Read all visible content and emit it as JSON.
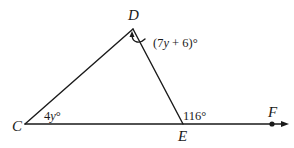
{
  "diagram": {
    "type": "geometry-triangle-exterior-angle",
    "points": {
      "C": {
        "label": "C",
        "x": 25,
        "y": 124
      },
      "D": {
        "label": "D",
        "x": 133,
        "y": 29
      },
      "E": {
        "label": "E",
        "x": 183,
        "y": 124
      },
      "F": {
        "label": "F",
        "x": 272,
        "y": 124
      }
    },
    "segments": [
      "CD",
      "DE",
      "CE",
      "EF (ray)"
    ],
    "angles": {
      "C": {
        "label_prefix": "4",
        "label_var": "y",
        "label_suffix": "°"
      },
      "D": {
        "label_open": "(7",
        "label_var": "y",
        "label_rest": " + 6)°"
      },
      "DEF_exterior": {
        "label": "116°"
      }
    },
    "colors": {
      "stroke": "#1a1a1a",
      "background": "#ffffff"
    }
  }
}
